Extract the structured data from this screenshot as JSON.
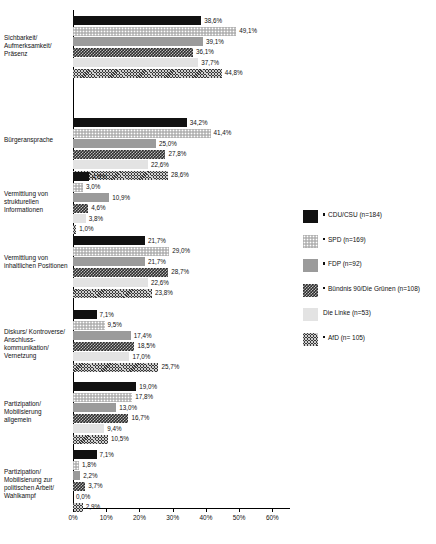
{
  "chart_data": {
    "type": "bar",
    "orientation": "horizontal",
    "title": "",
    "xlabel": "",
    "ylabel": "",
    "xlim": [
      0,
      65
    ],
    "grid": false,
    "legend_position": "right",
    "xtick_labels": [
      "0%",
      "10%",
      "20%",
      "30%",
      "40%",
      "50%",
      "60%"
    ],
    "xtick_values": [
      0,
      10,
      20,
      30,
      40,
      50,
      60
    ],
    "categories": [
      "Sichbarkeit/ Aufmerksamkeit/ Präsenz",
      "Bürgeransprache",
      "Vermittlung von strukturellen Informationen",
      "Vermittlung von inhaltlichen Positionen",
      "Diskurs/ Kontroverse/ Anschluss- kommunikation/ Vernetzung",
      "Partizipation/ Mobilisierung allgemein",
      "Partizipation/ Mobilisierung zur politischen Arbeit/ Wahlkampf"
    ],
    "series": [
      {
        "name": "CDU/CSU (n=184)",
        "pattern": "solid-black",
        "values": [
          38.6,
          34.2,
          4.9,
          21.7,
          7.1,
          19.0,
          7.1
        ],
        "labels": [
          "38,6%",
          "34,2%",
          "4,9%",
          "21,7%",
          "7,1%",
          "19,0%",
          "7,1%"
        ]
      },
      {
        "name": "SPD (n=169)",
        "pattern": "light-dotted",
        "values": [
          49.1,
          41.4,
          3.0,
          29.0,
          9.5,
          17.8,
          1.8
        ],
        "labels": [
          "49,1%",
          "41,4%",
          "3,0%",
          "29,0%",
          "9,5%",
          "17,8%",
          "1,8%"
        ]
      },
      {
        "name": "FDP (n=92)",
        "pattern": "solid-gray",
        "values": [
          39.1,
          25.0,
          10.9,
          21.7,
          17.4,
          13.0,
          2.2
        ],
        "labels": [
          "39,1%",
          "25,0%",
          "10,9%",
          "21,7%",
          "17,4%",
          "13,0%",
          "2,2%"
        ]
      },
      {
        "name": "Bündnis 90/Die Grünen (n=108)",
        "pattern": "dark-zigzag",
        "values": [
          36.1,
          27.8,
          4.6,
          28.7,
          18.5,
          16.7,
          3.7
        ],
        "labels": [
          "36,1%",
          "27,8%",
          "4,6%",
          "28,7%",
          "18,5%",
          "16,7%",
          "3,7%"
        ]
      },
      {
        "name": "Die Linke (n=53)",
        "pattern": "very-light",
        "values": [
          37.7,
          22.6,
          3.8,
          22.6,
          17.0,
          9.4,
          0.0
        ],
        "labels": [
          "37,7%",
          "22,6%",
          "3,8%",
          "22,6%",
          "17,0%",
          "9,4%",
          "0,0%"
        ]
      },
      {
        "name": "AfD (n= 105)",
        "pattern": "dark-crosshatch",
        "values": [
          44.8,
          28.6,
          1.0,
          23.8,
          25.7,
          10.5,
          2.9
        ],
        "labels": [
          "44,8%",
          "28,6%",
          "1,0%",
          "23,8%",
          "25,7%",
          "10,5%",
          "2,9%"
        ]
      }
    ]
  },
  "legend": {
    "items": [
      {
        "label": "CDU/CSU (n=184)",
        "marker": true
      },
      {
        "label": "SPD (n=169)",
        "marker": true
      },
      {
        "label": "FDP (n=92)",
        "marker": true
      },
      {
        "label": "Bündnis 90/Die Grünen (n=108)",
        "marker": true
      },
      {
        "label": "Die Linke (n=53)",
        "marker": false
      },
      {
        "label": "AfD (n= 105)",
        "marker": true
      }
    ]
  },
  "caption": ""
}
